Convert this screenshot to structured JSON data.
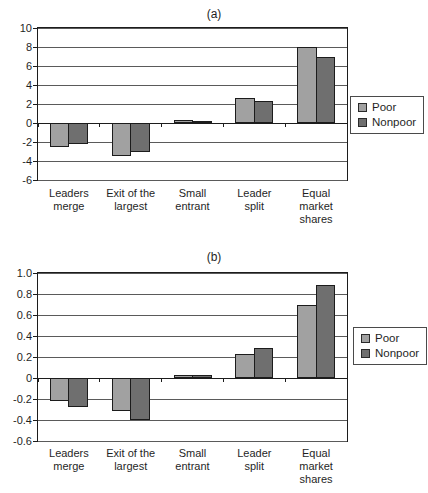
{
  "figure": {
    "background": "#ffffff",
    "text_color": "#1f1f1f",
    "gridline_color": "#5a5a5a",
    "axis_color": "#1c1c1c"
  },
  "chart_data": [
    {
      "type": "bar",
      "title": "(a)",
      "categories": [
        "Leaders\nmerge",
        "Exit of the\nlargest",
        "Small\nentrant",
        "Leader\nsplit",
        "Equal\nmarket\nshares"
      ],
      "series": [
        {
          "name": "Poor",
          "color": "#a1a1a1",
          "values": [
            -2.5,
            -3.5,
            0.3,
            2.6,
            8.0
          ]
        },
        {
          "name": "Nonpoor",
          "color": "#6f6f6f",
          "values": [
            -2.2,
            -3.0,
            0.25,
            2.3,
            7.0
          ]
        }
      ],
      "ylim": [
        -6,
        10
      ],
      "ytick_values": [
        10,
        8,
        6,
        4,
        2,
        0,
        -2,
        -4,
        -6
      ],
      "ytick_labels": [
        "10",
        "8",
        "6",
        "4",
        "2",
        "0",
        "-2",
        "-4",
        "-6"
      ],
      "grid": true,
      "legend_position": "right",
      "legend_entries": [
        "Poor",
        "Nonpoor"
      ]
    },
    {
      "type": "bar",
      "title": "(b)",
      "categories": [
        "Leaders\nmerge",
        "Exit of the\nlargest",
        "Small\nentrant",
        "Leader\nsplit",
        "Equal\nmarket\nshares"
      ],
      "series": [
        {
          "name": "Poor",
          "color": "#a1a1a1",
          "values": [
            -0.22,
            -0.31,
            0.03,
            0.23,
            0.7
          ]
        },
        {
          "name": "Nonpoor",
          "color": "#6f6f6f",
          "values": [
            -0.28,
            -0.4,
            0.03,
            0.29,
            0.89
          ]
        }
      ],
      "ylim": [
        -0.6,
        1.0
      ],
      "ytick_values": [
        1.0,
        0.8,
        0.6,
        0.4,
        0.2,
        0,
        -0.2,
        -0.4,
        -0.6
      ],
      "ytick_labels": [
        "1.0",
        "0.8",
        "0.6",
        "0.4",
        "0.2",
        "0",
        "-0.2",
        "-0.4",
        "-0.6"
      ],
      "grid": true,
      "legend_position": "right",
      "legend_entries": [
        "Poor",
        "Nonpoor"
      ]
    }
  ]
}
